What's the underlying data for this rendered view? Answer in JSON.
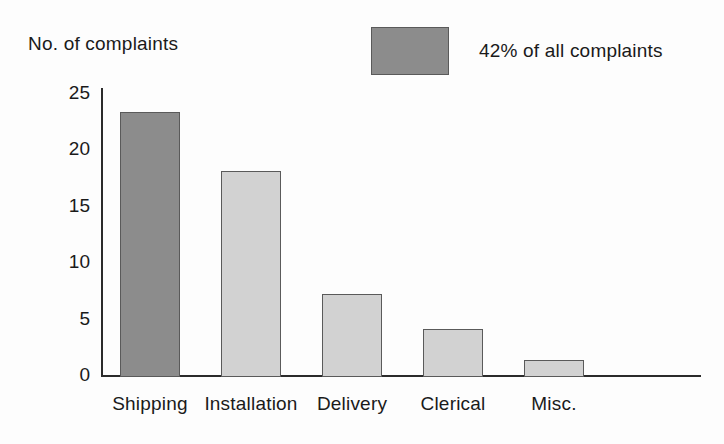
{
  "chart_data": {
    "type": "bar",
    "title": "",
    "ylabel": "No. of complaints",
    "xlabel": "",
    "categories": [
      "Shipping",
      "Installation",
      "Delivery",
      "Clerical",
      "Misc."
    ],
    "values": [
      23.5,
      18.3,
      7.4,
      4.3,
      1.5
    ],
    "bar_colors": [
      "#8c8c8c",
      "#d2d2d2",
      "#d2d2d2",
      "#d2d2d2",
      "#d2d2d2"
    ],
    "ylim": [
      0,
      25
    ],
    "ytick_labels": [
      "25",
      "20",
      "15",
      "10",
      "5",
      "0"
    ],
    "ytick_values": [
      25,
      20,
      15,
      10,
      5,
      0
    ],
    "grid": false,
    "legend": {
      "position": "top-right",
      "entries": [
        {
          "label": "42% of all complaints",
          "color": "#8c8c8c"
        }
      ]
    },
    "highlight_color": "#8c8c8c",
    "base_color": "#d2d2d2",
    "axis_color": "#2b2b2b"
  },
  "axis_title": "No. of complaints",
  "legend_label": "42% of all complaints"
}
